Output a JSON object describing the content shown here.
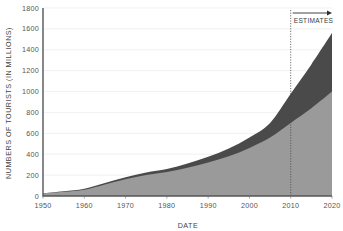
{
  "chart_data": {
    "type": "area",
    "title": "",
    "xlabel": "DATE",
    "ylabel": "NUMBERS OF TOURISTS (IN MILLIONS)",
    "xlim": [
      1950,
      2020
    ],
    "ylim": [
      0,
      1800
    ],
    "grid": true,
    "legend": "none",
    "stacked": true,
    "x": [
      1950,
      1955,
      1960,
      1965,
      1970,
      1975,
      1980,
      1985,
      1990,
      1995,
      2000,
      2005,
      2010,
      2015,
      2020
    ],
    "series": [
      {
        "name": "actual-and-baseline",
        "color": "#9a9a9a",
        "values": [
          25,
          40,
          60,
          110,
          160,
          200,
          230,
          270,
          320,
          380,
          460,
          560,
          700,
          840,
          1000
        ]
      },
      {
        "name": "upper-band",
        "color": "#4a4a4a",
        "values": [
          25,
          45,
          70,
          125,
          180,
          225,
          258,
          310,
          375,
          455,
          560,
          700,
          980,
          1260,
          1560
        ]
      }
    ],
    "x_ticks": [
      "1950",
      "1960",
      "1970",
      "1980",
      "1990",
      "2000",
      "2010",
      "2020"
    ],
    "x_tick_values": [
      1950,
      1960,
      1970,
      1980,
      1990,
      2000,
      2010,
      2020
    ],
    "y_ticks": [
      "0",
      "200",
      "400",
      "600",
      "800",
      "1000",
      "1200",
      "1400",
      "1600",
      "1800"
    ],
    "y_tick_values": [
      0,
      200,
      400,
      600,
      800,
      1000,
      1200,
      1400,
      1600,
      1800
    ],
    "annotations": [
      {
        "name": "estimates",
        "label": "ESTIMATES",
        "at_x": 2010,
        "arrow_direction": "right"
      }
    ]
  },
  "colors": {
    "light_area": "#9a9a9a",
    "dark_area": "#4a4a4a",
    "axis": "#555555",
    "grid": "#eceaea",
    "text": "#555555",
    "background": "#ffffff"
  }
}
